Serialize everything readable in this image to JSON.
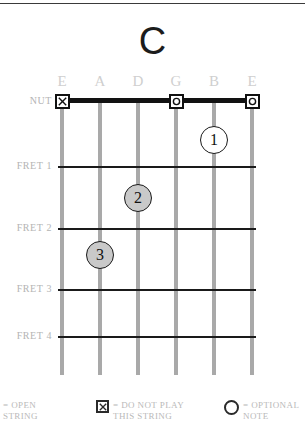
{
  "chord": {
    "name": "C",
    "title_label": "C"
  },
  "strings": [
    {
      "label": "E",
      "x": 62
    },
    {
      "label": "A",
      "x": 100
    },
    {
      "label": "D",
      "x": 138
    },
    {
      "label": "G",
      "x": 176
    },
    {
      "label": "B",
      "x": 214
    },
    {
      "label": "E",
      "x": 252
    }
  ],
  "rows": [
    {
      "label": "NUT",
      "y": 101
    },
    {
      "label": "FRET 1",
      "y": 166
    },
    {
      "label": "FRET 2",
      "y": 228
    },
    {
      "label": "FRET 3",
      "y": 289
    },
    {
      "label": "FRET 4",
      "y": 336
    }
  ],
  "nut_markers": [
    {
      "symbol": "X",
      "icon": "do-not-play-icon",
      "string": 0,
      "x": 62,
      "y": 101
    },
    {
      "symbol": "O",
      "icon": "open-string-icon",
      "string": 3,
      "x": 176,
      "y": 101
    },
    {
      "symbol": "O",
      "icon": "open-string-icon",
      "string": 5,
      "x": 252,
      "y": 101
    }
  ],
  "finger_dots": [
    {
      "finger": "1",
      "x": 214,
      "y": 140,
      "style": "open"
    },
    {
      "finger": "2",
      "x": 138,
      "y": 198,
      "style": "filled"
    },
    {
      "finger": "3",
      "x": 100,
      "y": 255,
      "style": "filled"
    }
  ],
  "legend": [
    {
      "icon": "open-string-icon",
      "symbol": "O",
      "text": "= OPEN\nSTRING",
      "x": -14,
      "icon_visible": true
    },
    {
      "icon": "do-not-play-icon",
      "symbol": "X",
      "text": "= DO NOT PLAY\n   THIS STRING",
      "x": 96,
      "icon_visible": true
    },
    {
      "icon": "optional-note-icon",
      "symbol": "",
      "text": "= OPTIONAL\n    NOTE",
      "x": 224,
      "icon_visible": true
    }
  ],
  "colors": {
    "string": "#a9a9a9",
    "fret": "#1a1a1a",
    "nut": "#121212",
    "label_gray": "#cfcfcf",
    "row_label_gray": "#b4b4b4",
    "legend_gray": "#b9b9b9",
    "dot_fill": "#c9c9c9",
    "title": "#1c1c1c"
  }
}
